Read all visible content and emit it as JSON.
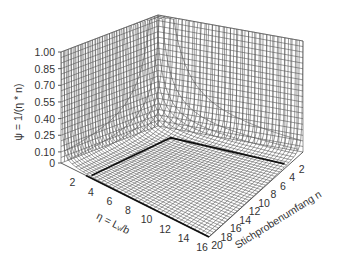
{
  "chart_data": {
    "type": "surface3d",
    "title": "",
    "zlabel": "ψ = 1/(η * n)",
    "xlabel": "η = Lᵥ/b",
    "ylabel": "Stichprobenumfang n",
    "x_ticks": [
      "2",
      "4",
      "6",
      "8",
      "10",
      "12",
      "14",
      "16"
    ],
    "x_range": [
      0,
      16
    ],
    "y_ticks": [
      "2",
      "4",
      "6",
      "8",
      "10",
      "12",
      "14",
      "16",
      "18",
      "20"
    ],
    "y_range": [
      0,
      20
    ],
    "z_ticks": [
      "0",
      "0.10",
      "0.25",
      "0.40",
      "0.55",
      "0.70",
      "0.85",
      "1.00"
    ],
    "z_range": [
      0,
      1.0
    ],
    "function": "psi = 1/(eta*n), clipped to [0,1]",
    "highlight_contour": {
      "eta_min": 3,
      "n_min": 3,
      "note": "thick black line on floor"
    },
    "grid": true,
    "style": "wireframe mesh, black lines on white"
  }
}
